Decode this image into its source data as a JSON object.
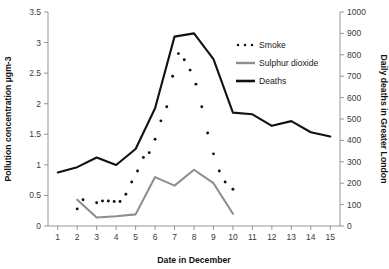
{
  "chart_data": {
    "type": "line",
    "title": "",
    "xlabel": "Date in December",
    "ylabel": "Pollution concentration µgm-3",
    "y2label": "Daily deaths in Greater London",
    "xlim": [
      0.5,
      15.5
    ],
    "ylim": [
      0,
      3.5
    ],
    "y2lim": [
      0,
      1000
    ],
    "grid": false,
    "legend_position": "top-right",
    "x_ticks": [
      "1",
      "2",
      "3",
      "4",
      "5",
      "6",
      "7",
      "8",
      "9",
      "10",
      "11",
      "12",
      "13",
      "14",
      "15"
    ],
    "y_ticks": [
      "0",
      "0.5",
      "1",
      "1.5",
      "2",
      "2.5",
      "3",
      "3.5"
    ],
    "y2_ticks": [
      "0",
      "100",
      "200",
      "300",
      "400",
      "500",
      "600",
      "700",
      "800",
      "900",
      "1000"
    ],
    "series": [
      {
        "name": "Smoke",
        "style": "dotted",
        "color": "#111111",
        "axis": "left",
        "unit": "µgm-3",
        "x": [
          2,
          2.3,
          3,
          3.3,
          3.6,
          3.9,
          4.2,
          4.5,
          4.8,
          5.1,
          5.4,
          5.7,
          6,
          6.3,
          6.6,
          6.9,
          7.2,
          7.5,
          7.8,
          8.1,
          8.4,
          8.7,
          9,
          9.3,
          9.6,
          10
        ],
        "values": [
          0.28,
          0.43,
          0.38,
          0.41,
          0.41,
          0.4,
          0.4,
          0.52,
          0.72,
          0.9,
          1.12,
          1.2,
          1.42,
          1.72,
          1.95,
          2.45,
          2.82,
          2.72,
          2.55,
          2.32,
          1.95,
          1.52,
          1.18,
          0.9,
          0.72,
          0.6
        ]
      },
      {
        "name": "Sulphur dioxide",
        "style": "solid",
        "color": "#8e8e8e",
        "axis": "left",
        "unit": "µgm-3",
        "x": [
          2,
          3,
          4,
          5,
          6,
          7,
          8,
          9,
          10
        ],
        "values": [
          0.43,
          0.14,
          0.16,
          0.19,
          0.8,
          0.66,
          0.92,
          0.7,
          0.2
        ]
      },
      {
        "name": "Deaths",
        "style": "solid",
        "color": "#111111",
        "axis": "right",
        "unit": "deaths/day",
        "x": [
          1,
          2,
          3,
          4,
          5,
          6,
          7,
          8,
          9,
          10,
          11,
          12,
          13,
          14,
          15
        ],
        "values": [
          250,
          275,
          320,
          285,
          360,
          550,
          885,
          900,
          780,
          530,
          522,
          468,
          490,
          438,
          418
        ],
        "values_left_scale": [
          0.88,
          0.96,
          1.1,
          0.98,
          1.26,
          1.92,
          3.08,
          3.13,
          2.72,
          1.85,
          1.82,
          1.63,
          1.71,
          1.53,
          1.46
        ]
      }
    ],
    "legend": [
      {
        "label": "Smoke",
        "marker": "dotted",
        "color": "#111111"
      },
      {
        "label": "Sulphur dioxide",
        "marker": "line",
        "color": "#8e8e8e"
      },
      {
        "label": "Deaths",
        "marker": "line",
        "color": "#111111"
      }
    ]
  }
}
